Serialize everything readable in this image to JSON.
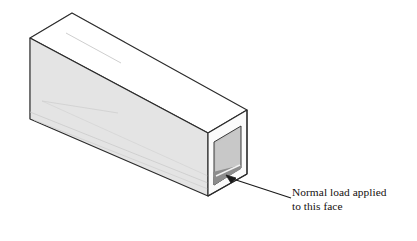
{
  "figure": {
    "type": "isometric-technical-illustration",
    "background_color": "#ffffff"
  },
  "annotation": {
    "name": "normal-load-callout",
    "line1": "Normal load applied",
    "line2": "to this face",
    "text_color": "#15110f",
    "leader_line": {
      "from_x": 290,
      "from_y": 197,
      "to_x": 231,
      "to_y": 178,
      "color": "#1a1a1a",
      "width": 1.1
    },
    "arrowhead": {
      "tip_x": 226,
      "tip_y": 175,
      "color": "#1a1a1a"
    }
  },
  "tube": {
    "name": "hollow-rectangular-tube",
    "outline_color": "#2b2b2b",
    "faint_line_color": "#b9b9b9",
    "colors": {
      "top_face": "#ffffff",
      "front_side_face": "#e4e4e4",
      "left_end_face": "#fdfdfd",
      "right_rim_face": "#fbfbfb",
      "right_inner_back_wall": "#c3c3c3",
      "right_inner_bottom": "#8d8d8d",
      "inner_shadow": "#d4d4d4"
    },
    "geometry": {
      "top_apex": [
        72,
        13
      ],
      "top_right": [
        247,
        110
      ],
      "left_top_front": [
        30,
        38
      ],
      "left_bottom_front": [
        30,
        119
      ],
      "front_bottom_right": [
        208,
        196
      ],
      "right_bottom": [
        247,
        174
      ],
      "wall_thickness_px": 7
    }
  }
}
